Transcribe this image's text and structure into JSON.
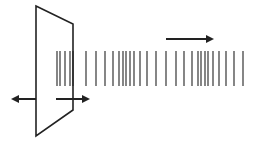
{
  "diagram": {
    "colors": {
      "ink": "#222222",
      "background": "#ffffff"
    },
    "plate": {
      "points": [
        [
          36,
          6
        ],
        [
          73,
          24
        ],
        [
          73,
          110
        ],
        [
          36,
          136
        ]
      ]
    },
    "plate_motion_arrows": [
      {
        "name": "left-arrow",
        "x1": 36,
        "x2": 13,
        "y": 99
      },
      {
        "name": "right-arrow",
        "x1": 56,
        "x2": 88,
        "y": 99
      }
    ],
    "propagation_arrow": {
      "x1": 166,
      "x2": 212,
      "y": 39
    },
    "wave_lines": {
      "y_top": 51,
      "y_bottom": 86,
      "x_positions": [
        57,
        60,
        65,
        70,
        73,
        86,
        96,
        105,
        113,
        119,
        123,
        126,
        130,
        134,
        140,
        147,
        156,
        166,
        176,
        184,
        192,
        198,
        201,
        205,
        208,
        213,
        219,
        226,
        234,
        243
      ]
    }
  }
}
